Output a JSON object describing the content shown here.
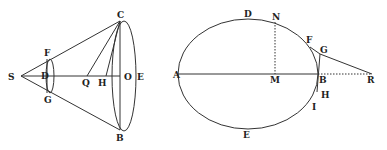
{
  "figure_left": {
    "title": "cone",
    "labels": {
      "S": "S",
      "F": "F",
      "D": "D",
      "G": "G",
      "C": "C",
      "Q": "Q",
      "H": "H",
      "O": "O",
      "E": "E",
      "B": "B"
    }
  },
  "figure_right": {
    "title": "ellipse",
    "labels": {
      "A": "A",
      "D": "D",
      "N": "N",
      "M": "M",
      "F": "F",
      "G": "G",
      "B": "B",
      "R": "R",
      "H": "H",
      "I": "I",
      "E": "E"
    }
  },
  "colors": {
    "ink": "#333333",
    "background": "#ffffff"
  }
}
